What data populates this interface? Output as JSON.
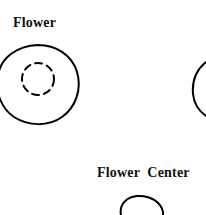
{
  "figure": {
    "background_color": "#ffffff",
    "stroke_color": "#000000",
    "width": 206,
    "height": 215,
    "labels": {
      "flower": "Flower",
      "flower_center": "Flower  Center"
    },
    "shapes": {
      "flower_outline": {
        "name": "flower-outline",
        "style": "solid",
        "description": "irregular rounded blob",
        "stroke_width": 2
      },
      "flower_center_dashed": {
        "name": "flower-center-dashed-circle",
        "style": "dashed",
        "description": "small dashed circle inside flower",
        "stroke_width": 2,
        "dash_pattern": "7 5"
      },
      "right_partial_arc": {
        "name": "right-cropped-flower-arc",
        "style": "solid",
        "description": "left edge of a neighboring flower cropped by panel border",
        "stroke_width": 2
      },
      "bottom_partial_circle": {
        "name": "bottom-cropped-center-circle",
        "style": "solid",
        "description": "top of a circle cropped by bottom panel border",
        "stroke_width": 2
      }
    }
  }
}
